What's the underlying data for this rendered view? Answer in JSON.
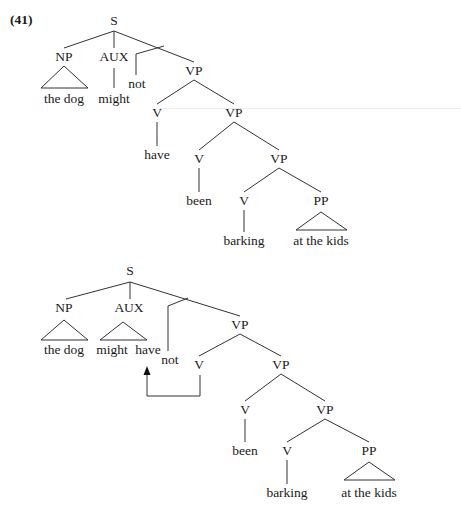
{
  "example_number": "(41)",
  "trees": [
    {
      "name": "tree-before-movement",
      "nodes": [
        {
          "id": "S",
          "label": "S",
          "x": 114,
          "y": 14
        },
        {
          "id": "NP",
          "label": "NP",
          "x": 64,
          "y": 50
        },
        {
          "id": "AUX",
          "label": "AUX",
          "x": 114,
          "y": 50
        },
        {
          "id": "not",
          "label": "not",
          "x": 137,
          "y": 77
        },
        {
          "id": "VP1",
          "label": "VP",
          "x": 194,
          "y": 64
        },
        {
          "id": "thedog",
          "label": "the dog",
          "x": 64,
          "y": 92
        },
        {
          "id": "might",
          "label": "might",
          "x": 114,
          "y": 92
        },
        {
          "id": "V1",
          "label": "V",
          "x": 157,
          "y": 106
        },
        {
          "id": "VP2",
          "label": "VP",
          "x": 234,
          "y": 106
        },
        {
          "id": "have",
          "label": "have",
          "x": 157,
          "y": 148
        },
        {
          "id": "V2",
          "label": "V",
          "x": 199,
          "y": 152
        },
        {
          "id": "VP3",
          "label": "VP",
          "x": 279,
          "y": 152
        },
        {
          "id": "been",
          "label": "been",
          "x": 199,
          "y": 194
        },
        {
          "id": "V3",
          "label": "V",
          "x": 244,
          "y": 194
        },
        {
          "id": "PP",
          "label": "PP",
          "x": 321,
          "y": 194
        },
        {
          "id": "barking",
          "label": "barking",
          "x": 244,
          "y": 234
        },
        {
          "id": "atthekids",
          "label": "at the kids",
          "x": 321,
          "y": 234
        }
      ],
      "edges": [
        [
          114,
          31,
          64,
          48
        ],
        [
          114,
          31,
          114,
          48
        ],
        [
          114,
          31,
          194,
          62
        ],
        [
          164,
          46,
          136,
          54
        ],
        [
          136,
          54,
          136,
          75
        ],
        [
          114,
          68,
          114,
          88
        ],
        [
          194,
          80,
          157,
          104
        ],
        [
          194,
          80,
          234,
          104
        ],
        [
          157,
          122,
          157,
          146
        ],
        [
          234,
          122,
          199,
          150
        ],
        [
          234,
          122,
          279,
          150
        ],
        [
          199,
          168,
          199,
          192
        ],
        [
          279,
          168,
          244,
          192
        ],
        [
          279,
          168,
          321,
          192
        ],
        [
          244,
          210,
          244,
          232
        ]
      ],
      "triangles": [
        [
          64,
          66,
          41,
          88,
          88,
          88
        ],
        [
          321,
          212,
          296,
          230,
          347,
          230
        ]
      ]
    },
    {
      "name": "tree-after-movement",
      "nodes": [
        {
          "id": "S",
          "label": "S",
          "x": 130,
          "y": 264
        },
        {
          "id": "NP",
          "label": "NP",
          "x": 64,
          "y": 301
        },
        {
          "id": "AUX",
          "label": "AUX",
          "x": 129,
          "y": 301
        },
        {
          "id": "VP1",
          "label": "VP",
          "x": 240,
          "y": 318
        },
        {
          "id": "thedog",
          "label": "the dog",
          "x": 64,
          "y": 343
        },
        {
          "id": "might",
          "label": "might",
          "x": 112,
          "y": 343
        },
        {
          "id": "have",
          "label": "have",
          "x": 148,
          "y": 343
        },
        {
          "id": "not",
          "label": "not",
          "x": 170,
          "y": 353
        },
        {
          "id": "V1",
          "label": "V",
          "x": 199,
          "y": 358
        },
        {
          "id": "VP2",
          "label": "VP",
          "x": 281,
          "y": 358
        },
        {
          "id": "V2",
          "label": "V",
          "x": 245,
          "y": 403
        },
        {
          "id": "VP3",
          "label": "VP",
          "x": 325,
          "y": 403
        },
        {
          "id": "been",
          "label": "been",
          "x": 245,
          "y": 444
        },
        {
          "id": "V3",
          "label": "V",
          "x": 287,
          "y": 444
        },
        {
          "id": "PP",
          "label": "PP",
          "x": 369,
          "y": 444
        },
        {
          "id": "barking",
          "label": "barking",
          "x": 287,
          "y": 486
        },
        {
          "id": "atthekids",
          "label": "at the kids",
          "x": 369,
          "y": 486
        }
      ],
      "edges": [
        [
          130,
          282,
          66,
          299
        ],
        [
          130,
          282,
          130,
          299
        ],
        [
          130,
          282,
          240,
          316
        ],
        [
          188,
          298,
          168,
          306
        ],
        [
          168,
          306,
          168,
          351
        ],
        [
          240,
          334,
          199,
          356
        ],
        [
          240,
          334,
          281,
          356
        ],
        [
          281,
          374,
          245,
          401
        ],
        [
          281,
          374,
          325,
          401
        ],
        [
          245,
          419,
          245,
          442
        ],
        [
          325,
          419,
          287,
          442
        ],
        [
          325,
          419,
          369,
          442
        ],
        [
          287,
          460,
          287,
          484
        ]
      ],
      "triangles": [
        [
          64,
          320,
          41,
          340,
          88,
          340
        ],
        [
          123,
          322,
          100,
          340,
          147,
          340
        ]
      ],
      "triangles_right": [
        [
          369,
          462,
          344,
          480,
          395,
          480
        ]
      ],
      "movement_arrow": {
        "from_label": "V",
        "to_label": "have",
        "path": [
          [
            200,
            375
          ],
          [
            200,
            396
          ],
          [
            147,
            396
          ],
          [
            147,
            372
          ]
        ],
        "arrow_tip": [
          147,
          366
        ]
      }
    }
  ],
  "colors": {
    "ink": "#1a1a1a",
    "line": "#333333"
  }
}
